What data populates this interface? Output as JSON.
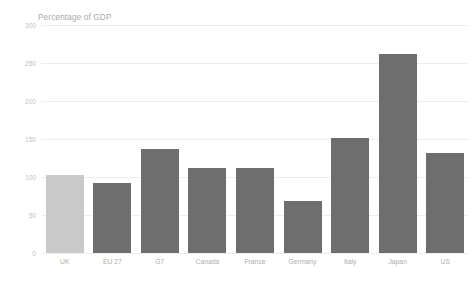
{
  "chart_data": {
    "type": "bar",
    "title": "Percentage of GDP",
    "xlabel": "",
    "ylabel": "",
    "categories": [
      "UK",
      "EU 27",
      "G7",
      "Canada",
      "France",
      "Germany",
      "Italy",
      "Japan",
      "US"
    ],
    "values": [
      103,
      92,
      137,
      112,
      112,
      69,
      151,
      262,
      132
    ],
    "ylim": [
      0,
      300
    ],
    "yticks": [
      0,
      50,
      100,
      150,
      200,
      250,
      300
    ],
    "ytick_labels": [
      "0",
      "50",
      "100",
      "150",
      "200",
      "250",
      "300"
    ],
    "grid": true,
    "grid_axis": "y",
    "legend": false,
    "bar_colors": [
      "#c9c9c9",
      "#6e6e6e",
      "#6e6e6e",
      "#6e6e6e",
      "#6e6e6e",
      "#6e6e6e",
      "#6e6e6e",
      "#6e6e6e",
      "#6e6e6e"
    ],
    "highlight_category": "UK"
  },
  "colors": {
    "background": "#ffffff",
    "gridline": "#ededed",
    "tick_text": "#bfbfbf",
    "category_text": "#adadad",
    "title_text": "#a8a8a8",
    "bar_default": "#6e6e6e",
    "bar_highlight": "#c9c9c9"
  }
}
